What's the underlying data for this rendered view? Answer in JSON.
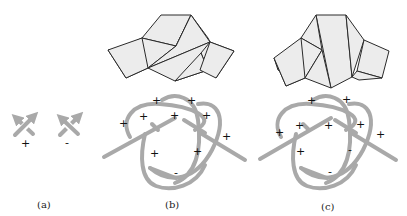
{
  "figure": {
    "panels": [
      {
        "id": "a",
        "label": "(a)",
        "crossings": [
          {
            "sign": "+",
            "description": "positive crossing"
          },
          {
            "sign": "-",
            "description": "negative crossing"
          }
        ]
      },
      {
        "id": "b",
        "label": "(b)",
        "signs": [
          "+",
          "+",
          "+",
          "+",
          "+",
          "+",
          "+",
          "+",
          "+",
          "-"
        ]
      },
      {
        "id": "c",
        "label": "(c)",
        "signs": [
          "+",
          "+",
          "+",
          "+",
          "+",
          "+",
          "+",
          "-",
          "-"
        ]
      }
    ],
    "colors": {
      "strand": "#a9a9a9",
      "polygon_fill": "#ececec",
      "polygon_stroke": "#2a2a2a",
      "text": "#111111"
    }
  }
}
